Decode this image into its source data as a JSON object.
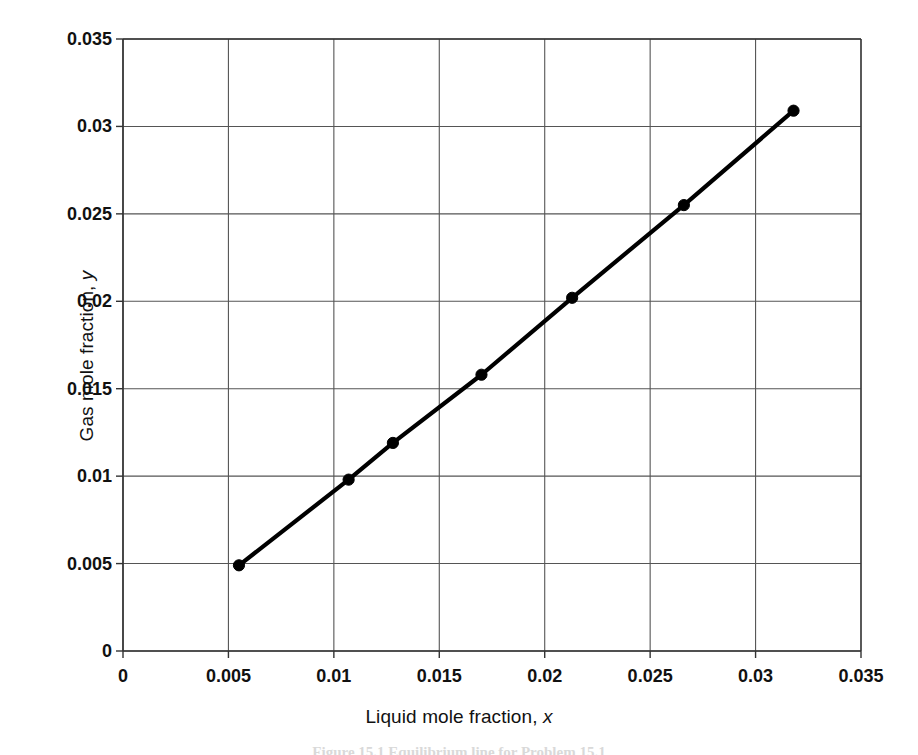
{
  "chart_data": {
    "type": "line",
    "title": "",
    "xlabel": "Liquid mole fraction, x",
    "ylabel": "Gas mole fraction, y",
    "xlim": [
      0,
      0.035
    ],
    "ylim": [
      0,
      0.035
    ],
    "xticks": [
      "0",
      "0.005",
      "0.01",
      "0.015",
      "0.02",
      "0.025",
      "0.03",
      "0.035"
    ],
    "xtick_values": [
      0,
      0.005,
      0.01,
      0.015,
      0.02,
      0.025,
      0.03,
      0.035
    ],
    "yticks": [
      "0",
      "0.005",
      "0.01",
      "0.015",
      "0.02",
      "0.025",
      "0.03",
      "0.035"
    ],
    "ytick_values": [
      0,
      0.005,
      0.01,
      0.015,
      0.02,
      0.025,
      0.03,
      0.035
    ],
    "grid": true,
    "legend": false,
    "marker": "filled-circle",
    "line_color": "#000000",
    "grid_color": "#555555",
    "axis_color": "#333333",
    "background": "#ffffff",
    "series": [
      {
        "name": "Equilibrium line",
        "x": [
          0.0055,
          0.0107,
          0.0128,
          0.017,
          0.0213,
          0.0266,
          0.0318
        ],
        "y": [
          0.0049,
          0.0098,
          0.0119,
          0.0158,
          0.0202,
          0.0255,
          0.0309
        ]
      }
    ]
  },
  "axis_labels": {
    "x_prefix": "Liquid mole fraction, ",
    "x_var": "x",
    "y_prefix": "Gas mole fraction, ",
    "y_var": "y"
  },
  "caption": {
    "text": "Figure 15.1 Equilibrium line for Problem 15.1"
  }
}
